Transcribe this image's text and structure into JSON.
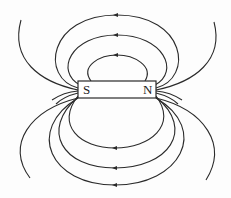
{
  "diagram": {
    "title": "",
    "type": "bar-magnet-field-lines",
    "magnet": {
      "south_label": "S",
      "north_label": "N",
      "x": 78,
      "y": 81,
      "width": 78,
      "height": 17
    },
    "colors": {
      "line": "#2a2a2a",
      "background": "#fdfdfd"
    },
    "field_lines": {
      "top_count": 4,
      "bottom_count": 4,
      "arrow_direction": "N-to-S (left) on top and bottom"
    }
  }
}
